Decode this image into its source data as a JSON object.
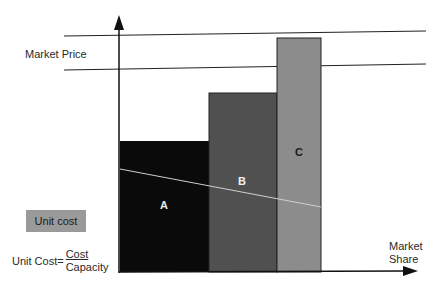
{
  "labels": {
    "market_price": "Market Price",
    "x_axis": [
      "Market",
      "Share"
    ],
    "unit_cost_box": "Unit cost",
    "formula_prefix": "Unit Cost=",
    "formula_numerator": "Cost",
    "formula_denominator": "Capacity"
  },
  "bars": [
    {
      "label": "A",
      "color": "#0a0a0a",
      "text_color": "#e8e8e8"
    },
    {
      "label": "B",
      "color": "#505050",
      "text_color": "#f0f0f0"
    },
    {
      "label": "C",
      "color": "#8c8c8c",
      "text_color": "#1a1a1a"
    }
  ],
  "colors": {
    "unit_cost_box": "#9a9a9a",
    "axis": "#111111",
    "unit_cost_line": "#cfcfcf"
  }
}
